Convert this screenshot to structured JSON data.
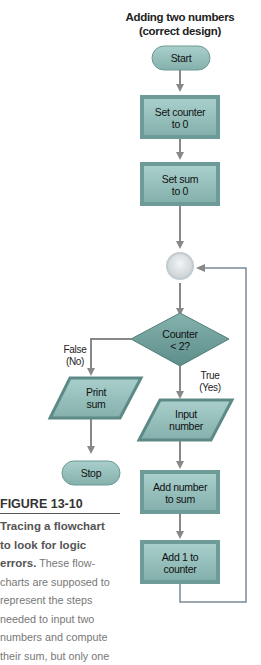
{
  "diagram": {
    "title_line1": "Adding two numbers",
    "title_line2": "(correct design)",
    "nodes": {
      "start": "Start",
      "set_counter_1": "Set counter",
      "set_counter_2": "to 0",
      "set_sum_1": "Set sum",
      "set_sum_2": "to 0",
      "decision_1": "Counter",
      "decision_2": "< 2?",
      "print_1": "Print",
      "print_2": "sum",
      "stop": "Stop",
      "input_1": "Input",
      "input_2": "number",
      "add_number_1": "Add number",
      "add_number_2": "to sum",
      "add_one_1": "Add 1 to",
      "add_one_2": "counter"
    },
    "branches": {
      "false_1": "False",
      "false_2": "(No)",
      "true_1": "True",
      "true_2": "(Yes)"
    },
    "colors": {
      "shape_fill": "#8fb8b4",
      "shape_dark": "#5a8a86",
      "decision_fill": "#6e9f9b",
      "connector": "#d8dde0",
      "arrow": "#888888",
      "loop_line": "#7a8a96"
    }
  },
  "caption": {
    "figure_label": "FIGURE 13-10",
    "title_bold": "Tracing a flowchart to look for logic errors.",
    "lines": [
      "Tracing a flowchart",
      "to look for logic",
      "errors.",
      " These flow-",
      "charts are supposed to",
      "represent the steps",
      "needed to input two",
      "numbers and compute",
      "their sum, but only one"
    ]
  }
}
